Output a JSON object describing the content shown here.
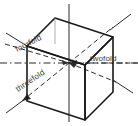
{
  "figure": {
    "type": "crystallographic-symmetry-axes-cube",
    "colors": {
      "cube_edge": "#1a1a1a",
      "axis_line": "#2b2b2b",
      "label_text": "#3a3a3a",
      "background": "#ffffff"
    },
    "labels": [
      {
        "id": "fourfold",
        "text": "fourfold",
        "position": "upper-left",
        "axis": "4-fold rotation axis through opposite face centres",
        "rotation_deg": -27,
        "x": 17,
        "y": 52
      },
      {
        "id": "threefold",
        "text": "threefold",
        "position": "lower-left",
        "axis": "3-fold rotation axis along body diagonal",
        "rotation_deg": -34,
        "x": 18,
        "y": 92
      },
      {
        "id": "twofold",
        "text": "twofold",
        "position": "right-centre",
        "axis": "2-fold rotation axis through opposite edge midpoints",
        "rotation_deg": 0,
        "x": 90,
        "y": 66
      }
    ],
    "axes": [
      {
        "id": "axis-fourfold-horizontal",
        "style": "dash-dot",
        "label_ref": "fourfold"
      },
      {
        "id": "axis-twofold-horizontal",
        "style": "dashed",
        "label_ref": "twofold"
      },
      {
        "id": "axis-threefold-diagonal",
        "style": "dashed",
        "label_ref": "threefold"
      },
      {
        "id": "axis-vertical",
        "style": "solid",
        "label_ref": null
      }
    ]
  }
}
